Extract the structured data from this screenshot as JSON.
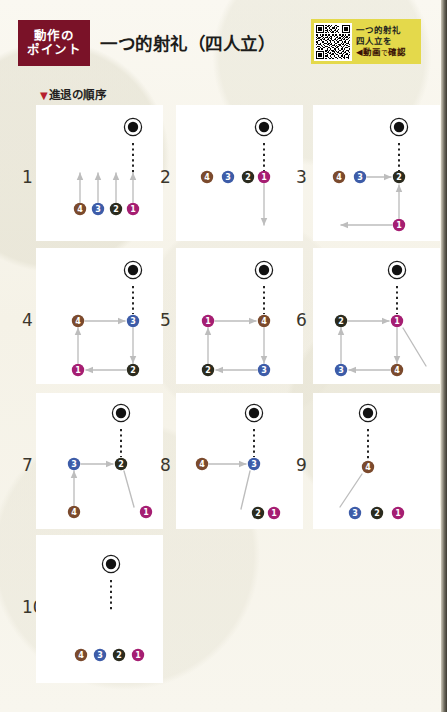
{
  "header": {
    "badge_line1": "動作の",
    "badge_line2": "ポイント",
    "badge_color": "#7a1228",
    "title": "一つ的射礼（四人立）",
    "qr": {
      "icon": "qr-code-icon",
      "line1": "一つ的射礼",
      "line2": "四人立を",
      "line3_arrow": "◀",
      "line3": "動画",
      "line3_small": "で",
      "line3_tail": "確認",
      "bg_color": "#e4d94b"
    },
    "section_label": "進退の順序",
    "section_marker": "▼"
  },
  "legend": {
    "colors": {
      "p1": "#a51e72",
      "p2": "#2b2b1e",
      "p3": "#3d5ca8",
      "p4": "#7b4a2d",
      "target": "#111111",
      "arrow": "#bdbdbd",
      "dash": "#1a1a1a"
    },
    "labels": {
      "p1": "1",
      "p2": "2",
      "p3": "3",
      "p4": "4"
    }
  },
  "panels": [
    {
      "index": "1",
      "caption": "全員が前進（四人横列から的線へ）"
    },
    {
      "index": "2",
      "caption": "一番が的線に進み下がる"
    },
    {
      "index": "3",
      "caption": "二番が的線へ、一番は左へ退く"
    },
    {
      "index": "4",
      "caption": "三番が的線へ、順に回る"
    },
    {
      "index": "5",
      "caption": "四番が的線へ、順に回る"
    },
    {
      "index": "6",
      "caption": "一番が的線へ、四番は斜めに退く"
    },
    {
      "index": "7",
      "caption": "二番が的線へ、三番は四番へ続く"
    },
    {
      "index": "8",
      "caption": "三番が的線へ、二番・一番は下座へ"
    },
    {
      "index": "9",
      "caption": "四番が的線へ、三番・二番・一番は下座へ"
    },
    {
      "index": "10",
      "caption": "全員が元の横列に戻る"
    }
  ],
  "chart_data": {
    "type": "diagram",
    "panels": [
      {
        "index": "1",
        "target": {
          "x": 97,
          "y": 22
        },
        "dash": {
          "x1": 97,
          "y1": 38,
          "x2": 97,
          "y2": 74
        },
        "markers": [
          {
            "id": "4",
            "x": 44,
            "y": 104,
            "color": "#7b4a2d"
          },
          {
            "id": "3",
            "x": 62,
            "y": 104,
            "color": "#3d5ca8"
          },
          {
            "id": "2",
            "x": 80,
            "y": 104,
            "color": "#2b2b1e"
          },
          {
            "id": "1",
            "x": 97,
            "y": 104,
            "color": "#a51e72"
          }
        ],
        "arrows": [
          {
            "x1": 44,
            "y1": 97,
            "x2": 44,
            "y2": 68
          },
          {
            "x1": 62,
            "y1": 97,
            "x2": 62,
            "y2": 68
          },
          {
            "x1": 80,
            "y1": 97,
            "x2": 80,
            "y2": 68
          },
          {
            "x1": 97,
            "y1": 97,
            "x2": 97,
            "y2": 68
          }
        ]
      },
      {
        "index": "2",
        "target": {
          "x": 88,
          "y": 22
        },
        "dash": {
          "x1": 88,
          "y1": 38,
          "x2": 88,
          "y2": 67
        },
        "markers": [
          {
            "id": "4",
            "x": 31,
            "y": 72,
            "color": "#7b4a2d"
          },
          {
            "id": "3",
            "x": 52,
            "y": 72,
            "color": "#3d5ca8"
          },
          {
            "id": "2",
            "x": 72,
            "y": 72,
            "color": "#2b2b1e"
          },
          {
            "id": "1",
            "x": 88,
            "y": 72,
            "color": "#a51e72"
          }
        ],
        "arrows": [
          {
            "x1": 88,
            "y1": 79,
            "x2": 88,
            "y2": 120
          }
        ]
      },
      {
        "index": "3",
        "target": {
          "x": 86,
          "y": 22
        },
        "dash": {
          "x1": 86,
          "y1": 38,
          "x2": 86,
          "y2": 66
        },
        "markers": [
          {
            "id": "4",
            "x": 26,
            "y": 72,
            "color": "#7b4a2d"
          },
          {
            "id": "3",
            "x": 47,
            "y": 72,
            "color": "#3d5ca8"
          },
          {
            "id": "2",
            "x": 86,
            "y": 72,
            "color": "#2b2b1e"
          },
          {
            "id": "1",
            "x": 86,
            "y": 120,
            "color": "#a51e72"
          }
        ],
        "arrows": [
          {
            "x1": 54,
            "y1": 72,
            "x2": 78,
            "y2": 72
          },
          {
            "x1": 86,
            "y1": 113,
            "x2": 86,
            "y2": 80
          },
          {
            "x1": 79,
            "y1": 120,
            "x2": 28,
            "y2": 120
          }
        ]
      },
      {
        "index": "4",
        "target": {
          "x": 97,
          "y": 22
        },
        "dash": {
          "x1": 97,
          "y1": 38,
          "x2": 97,
          "y2": 66
        },
        "markers": [
          {
            "id": "4",
            "x": 42,
            "y": 73,
            "color": "#7b4a2d"
          },
          {
            "id": "3",
            "x": 97,
            "y": 73,
            "color": "#3d5ca8"
          },
          {
            "id": "1",
            "x": 42,
            "y": 122,
            "color": "#a51e72"
          },
          {
            "id": "2",
            "x": 97,
            "y": 122,
            "color": "#2b2b1e"
          }
        ],
        "arrows": [
          {
            "x1": 49,
            "y1": 73,
            "x2": 89,
            "y2": 73
          },
          {
            "x1": 97,
            "y1": 80,
            "x2": 97,
            "y2": 115
          },
          {
            "x1": 90,
            "y1": 122,
            "x2": 50,
            "y2": 122
          },
          {
            "x1": 42,
            "y1": 115,
            "x2": 42,
            "y2": 80
          }
        ]
      },
      {
        "index": "5",
        "target": {
          "x": 88,
          "y": 22
        },
        "dash": {
          "x1": 88,
          "y1": 38,
          "x2": 88,
          "y2": 66
        },
        "markers": [
          {
            "id": "1",
            "x": 32,
            "y": 73,
            "color": "#a51e72"
          },
          {
            "id": "4",
            "x": 88,
            "y": 73,
            "color": "#7b4a2d"
          },
          {
            "id": "2",
            "x": 32,
            "y": 122,
            "color": "#2b2b1e"
          },
          {
            "id": "3",
            "x": 88,
            "y": 122,
            "color": "#3d5ca8"
          }
        ],
        "arrows": [
          {
            "x1": 39,
            "y1": 73,
            "x2": 80,
            "y2": 73
          },
          {
            "x1": 88,
            "y1": 80,
            "x2": 88,
            "y2": 115
          },
          {
            "x1": 81,
            "y1": 122,
            "x2": 40,
            "y2": 122
          },
          {
            "x1": 32,
            "y1": 115,
            "x2": 32,
            "y2": 80
          }
        ]
      },
      {
        "index": "6",
        "target": {
          "x": 84,
          "y": 22
        },
        "dash": {
          "x1": 84,
          "y1": 38,
          "x2": 84,
          "y2": 66
        },
        "markers": [
          {
            "id": "2",
            "x": 28,
            "y": 73,
            "color": "#2b2b1e"
          },
          {
            "id": "1",
            "x": 84,
            "y": 73,
            "color": "#a51e72"
          },
          {
            "id": "3",
            "x": 28,
            "y": 122,
            "color": "#3d5ca8"
          },
          {
            "id": "4",
            "x": 84,
            "y": 122,
            "color": "#7b4a2d"
          }
        ],
        "arrows": [
          {
            "x1": 35,
            "y1": 73,
            "x2": 76,
            "y2": 73
          },
          {
            "x1": 84,
            "y1": 80,
            "x2": 84,
            "y2": 115
          },
          {
            "x1": 77,
            "y1": 122,
            "x2": 36,
            "y2": 122
          },
          {
            "x1": 28,
            "y1": 115,
            "x2": 28,
            "y2": 80
          },
          {
            "x1": 90,
            "y1": 80,
            "x2": 113,
            "y2": 118,
            "noarrow": true
          }
        ]
      },
      {
        "index": "7",
        "target": {
          "x": 85,
          "y": 20
        },
        "dash": {
          "x1": 85,
          "y1": 36,
          "x2": 85,
          "y2": 64
        },
        "markers": [
          {
            "id": "3",
            "x": 38,
            "y": 71,
            "color": "#3d5ca8"
          },
          {
            "id": "2",
            "x": 85,
            "y": 71,
            "color": "#2b2b1e"
          },
          {
            "id": "4",
            "x": 38,
            "y": 119,
            "color": "#7b4a2d"
          },
          {
            "id": "1",
            "x": 110,
            "y": 119,
            "color": "#a51e72"
          }
        ],
        "arrows": [
          {
            "x1": 45,
            "y1": 71,
            "x2": 77,
            "y2": 71
          },
          {
            "x1": 38,
            "y1": 112,
            "x2": 38,
            "y2": 78
          },
          {
            "x1": 88,
            "y1": 78,
            "x2": 98,
            "y2": 114,
            "noarrow": true
          }
        ]
      },
      {
        "index": "8",
        "target": {
          "x": 78,
          "y": 20
        },
        "dash": {
          "x1": 78,
          "y1": 36,
          "x2": 78,
          "y2": 64
        },
        "markers": [
          {
            "id": "4",
            "x": 26,
            "y": 71,
            "color": "#7b4a2d"
          },
          {
            "id": "3",
            "x": 78,
            "y": 71,
            "color": "#3d5ca8"
          },
          {
            "id": "2",
            "x": 82,
            "y": 120,
            "color": "#2b2b1e"
          },
          {
            "id": "1",
            "x": 98,
            "y": 120,
            "color": "#a51e72"
          }
        ],
        "arrows": [
          {
            "x1": 33,
            "y1": 71,
            "x2": 70,
            "y2": 71
          },
          {
            "x1": 74,
            "y1": 78,
            "x2": 65,
            "y2": 116,
            "noarrow": true
          }
        ]
      },
      {
        "index": "9",
        "target": {
          "x": 55,
          "y": 20
        },
        "dash": {
          "x1": 55,
          "y1": 36,
          "x2": 55,
          "y2": 66
        },
        "markers": [
          {
            "id": "4",
            "x": 55,
            "y": 74,
            "color": "#7b4a2d"
          },
          {
            "id": "3",
            "x": 42,
            "y": 120,
            "color": "#3d5ca8"
          },
          {
            "id": "2",
            "x": 64,
            "y": 120,
            "color": "#2b2b1e"
          },
          {
            "id": "1",
            "x": 85,
            "y": 120,
            "color": "#a51e72"
          }
        ],
        "arrows": [
          {
            "x1": 49,
            "y1": 81,
            "x2": 27,
            "y2": 114,
            "noarrow": true
          }
        ]
      },
      {
        "index": "10",
        "target": {
          "x": 75,
          "y": 29
        },
        "dash": {
          "x1": 75,
          "y1": 45,
          "x2": 75,
          "y2": 77
        },
        "markers": [
          {
            "id": "4",
            "x": 45,
            "y": 120,
            "color": "#7b4a2d"
          },
          {
            "id": "3",
            "x": 64,
            "y": 120,
            "color": "#3d5ca8"
          },
          {
            "id": "2",
            "x": 83,
            "y": 120,
            "color": "#2b2b1e"
          },
          {
            "id": "1",
            "x": 102,
            "y": 120,
            "color": "#a51e72"
          }
        ],
        "arrows": []
      }
    ]
  }
}
